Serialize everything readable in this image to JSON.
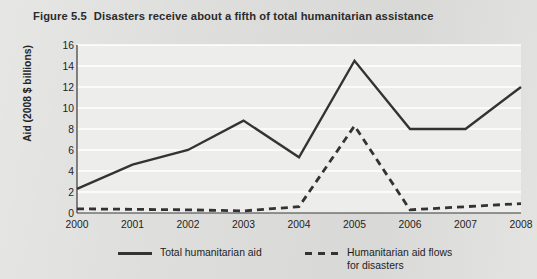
{
  "figure": {
    "number_label": "Figure 5.5",
    "title": "Disasters receive about a fifth of total humanitarian assistance"
  },
  "colors": {
    "page_background": "#dcdcda",
    "plot_background": "#ededec",
    "gridline": "#ffffff",
    "axis": "#3a3a3a",
    "series_line": "#333333",
    "text": "#1d1d1d"
  },
  "chart_data": {
    "type": "line",
    "title": "Disasters receive about a fifth of total humanitarian assistance",
    "xlabel": "",
    "ylabel": "Aid (2008 $ billions)",
    "x": [
      "2000",
      "2001",
      "2002",
      "2003",
      "2004",
      "2005",
      "2006",
      "2007",
      "2008"
    ],
    "categories": [
      "2000",
      "2001",
      "2002",
      "2003",
      "2004",
      "2005",
      "2006",
      "2007",
      "2008"
    ],
    "xtick_labels": [
      "2000",
      "2001",
      "2002",
      "2003",
      "2004",
      "2005",
      "2006",
      "2007",
      "2008"
    ],
    "ytick_labels": [
      "0",
      "2",
      "4",
      "6",
      "8",
      "10",
      "12",
      "14",
      "16"
    ],
    "yticks": [
      0,
      2,
      4,
      6,
      8,
      10,
      12,
      14,
      16
    ],
    "ylim": [
      0,
      16
    ],
    "grid": true,
    "grid_axis": "y",
    "legend_position": "below",
    "series": [
      {
        "name": "Total humanitarian aid",
        "style": "solid",
        "values": [
          2.3,
          4.6,
          6.0,
          8.8,
          5.3,
          14.5,
          8.0,
          8.0,
          12.0
        ]
      },
      {
        "name": "Humanitarian aid flows\nfor disasters",
        "style": "dashed",
        "values": [
          0.4,
          0.35,
          0.3,
          0.2,
          0.6,
          8.3,
          0.3,
          0.6,
          0.9
        ]
      }
    ]
  },
  "legend": {
    "items": [
      {
        "label": "Total humanitarian aid",
        "style": "solid"
      },
      {
        "label": "Humanitarian aid flows\nfor disasters",
        "style": "dashed"
      }
    ]
  }
}
